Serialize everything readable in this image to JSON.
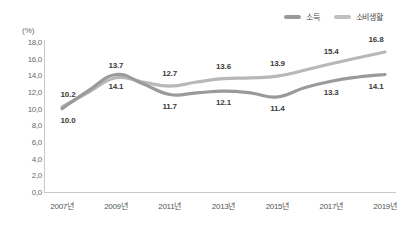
{
  "chart_data": {
    "type": "line",
    "title": "",
    "xlabel": "",
    "ylabel": "",
    "unit_label": "(%)",
    "ylim": [
      0.0,
      18.0
    ],
    "ytick_step": 2.0,
    "yticks": [
      "18,0",
      "16,0",
      "14,0",
      "12,0",
      "10,0",
      "8,0",
      "6,0",
      "4,0",
      "2,0",
      "0,0"
    ],
    "ytick_values": [
      18.0,
      16.0,
      14.0,
      12.0,
      10.0,
      8.0,
      6.0,
      4.0,
      2.0,
      0.0
    ],
    "grid": false,
    "legend_position": "top-right",
    "x": [
      2007,
      2008,
      2009,
      2010,
      2011,
      2012,
      2013,
      2014,
      2015,
      2016,
      2017,
      2018,
      2019
    ],
    "categories": [
      "2007년",
      "",
      "2009년",
      "",
      "2011년",
      "",
      "2013년",
      "",
      "2015년",
      "",
      "2017년",
      "",
      "2019년"
    ],
    "xtick_labels": [
      "2007년",
      "2009년",
      "2011년",
      "2013년",
      "2015년",
      "2017년",
      "2019년"
    ],
    "xtick_values": [
      2007,
      2009,
      2011,
      2013,
      2015,
      2017,
      2019
    ],
    "series": [
      {
        "name": "소비생활",
        "color": "#b8b8b8",
        "values": [
          10.2,
          12.0,
          13.7,
          13.2,
          12.7,
          13.2,
          13.6,
          13.7,
          13.9,
          14.6,
          15.4,
          16.1,
          16.8
        ],
        "labeled_points": [
          {
            "x": 2007,
            "value": 10.2,
            "text": "10.2"
          },
          {
            "x": 2009,
            "value": 13.7,
            "text": "13.7"
          },
          {
            "x": 2011,
            "value": 12.7,
            "text": "12.7"
          },
          {
            "x": 2013,
            "value": 13.6,
            "text": "13.6"
          },
          {
            "x": 2015,
            "value": 13.9,
            "text": "13.9"
          },
          {
            "x": 2017,
            "value": 15.4,
            "text": "15.4"
          },
          {
            "x": 2019,
            "value": 16.8,
            "text": "16.8"
          }
        ]
      },
      {
        "name": "소득",
        "color": "#9a9a9a",
        "values": [
          10.0,
          12.2,
          14.1,
          13.0,
          11.7,
          11.9,
          12.1,
          11.9,
          11.4,
          12.5,
          13.3,
          13.8,
          14.1
        ],
        "labeled_points": [
          {
            "x": 2007,
            "value": 10.0,
            "text": "10.0"
          },
          {
            "x": 2009,
            "value": 14.1,
            "text": "14.1"
          },
          {
            "x": 2011,
            "value": 11.7,
            "text": "11.7"
          },
          {
            "x": 2013,
            "value": 12.1,
            "text": "12.1"
          },
          {
            "x": 2015,
            "value": 11.4,
            "text": "11.4"
          },
          {
            "x": 2017,
            "value": 13.3,
            "text": "13.3"
          },
          {
            "x": 2019,
            "value": 14.1,
            "text": "14.1"
          }
        ]
      }
    ]
  },
  "legend": {
    "items": [
      {
        "label": "소득",
        "color": "#9a9a9a"
      },
      {
        "label": "소비생활",
        "color": "#c0c0c0"
      }
    ]
  }
}
